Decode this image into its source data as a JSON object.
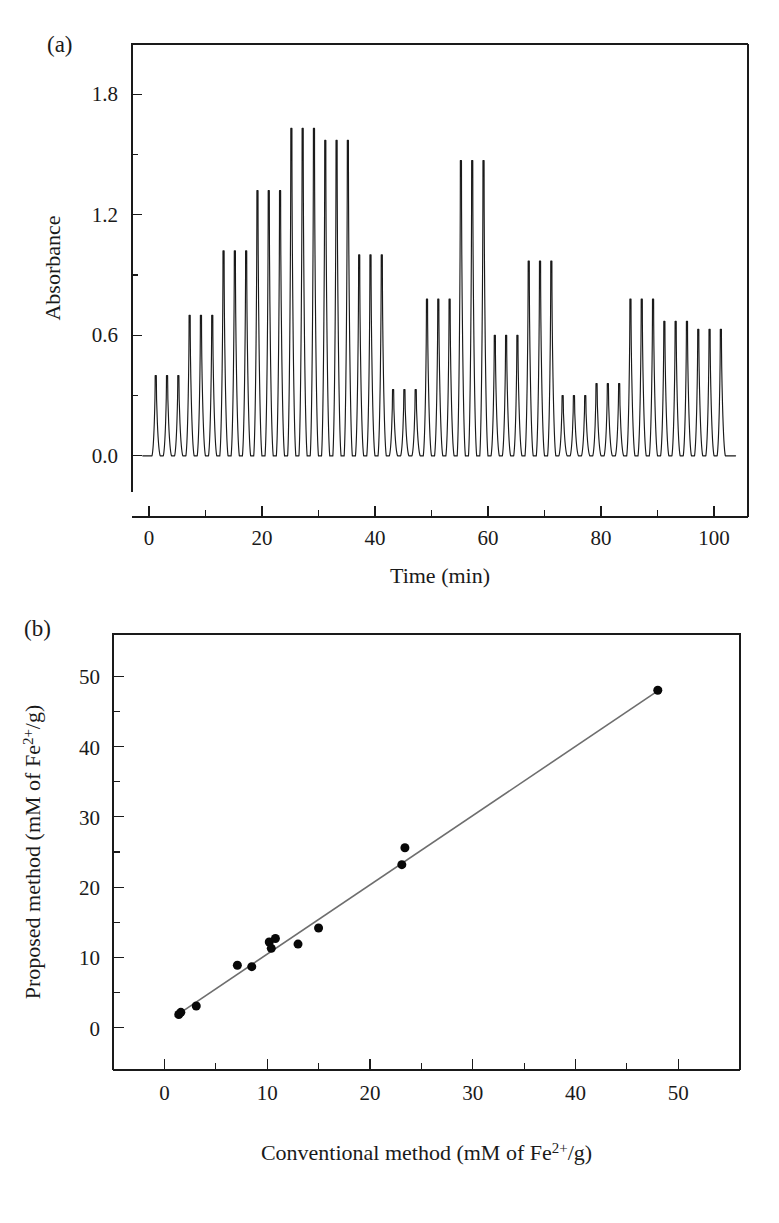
{
  "figure": {
    "panel_a_label": "(a)",
    "panel_b_label": "(b)"
  },
  "chart_data": [
    {
      "id": "panel-a",
      "type": "line",
      "title": "",
      "xlabel": "Time (min)",
      "ylabel": "Absorbance",
      "xlim": [
        -3,
        106
      ],
      "ylim": [
        -0.18,
        2.05
      ],
      "xticks": [
        0,
        20,
        40,
        60,
        80,
        100
      ],
      "xticks_minor": [
        10,
        30,
        50,
        70,
        90
      ],
      "yticks": [
        0.0,
        0.6,
        1.2,
        1.8
      ],
      "ytick_labels": [
        "0.0",
        "0.6",
        "1.2",
        "1.8"
      ],
      "yticks_minor": [
        0.3,
        0.9,
        1.5
      ],
      "grid": false,
      "legend": "none",
      "description": "Flow-injection absorbance trace: 17 triplicate injections (5 standards then 12 samples).",
      "peak_groups": [
        {
          "label": "0.1 mM",
          "x_center": 3.2,
          "height": 0.4
        },
        {
          "label": "0.2 mM",
          "x_center": 9.2,
          "height": 0.7
        },
        {
          "label": "0.3 mM",
          "x_center": 15.2,
          "height": 1.02
        },
        {
          "label": "0.4 mM",
          "x_center": 21.2,
          "height": 1.32
        },
        {
          "label": "0.5 mM",
          "x_center": 27.2,
          "height": 1.63
        },
        {
          "label": "SMP-1",
          "x_center": 33.2,
          "height": 1.57
        },
        {
          "label": "SMP-2",
          "x_center": 39.2,
          "height": 1.0
        },
        {
          "label": "SMP-3",
          "x_center": 45.2,
          "height": 0.33
        },
        {
          "label": "SMP-4",
          "x_center": 51.2,
          "height": 0.78
        },
        {
          "label": "SMP-5",
          "x_center": 57.2,
          "height": 1.47
        },
        {
          "label": "SMP-6",
          "x_center": 63.2,
          "height": 0.6
        },
        {
          "label": "SMP-7",
          "x_center": 69.2,
          "height": 0.97
        },
        {
          "label": "SMP-8",
          "x_center": 75.2,
          "height": 0.3
        },
        {
          "label": "SMP-9",
          "x_center": 81.2,
          "height": 0.36
        },
        {
          "label": "SMP-10",
          "x_center": 87.2,
          "height": 0.78
        },
        {
          "label": "SMP-11",
          "x_center": 93.2,
          "height": 0.67
        },
        {
          "label": "SMP-12",
          "x_center": 99.2,
          "height": 0.63
        }
      ],
      "peaks_per_group": 3,
      "peak_spacing": 2.0,
      "peak_width": 1.1,
      "baseline": 0.0
    },
    {
      "id": "panel-b",
      "type": "scatter",
      "title": "",
      "xlabel": "Conventional method (mM of Fe2+/g)",
      "xlabel_parts": {
        "pre": "Conventional method (mM of Fe",
        "sup": "2+",
        "post": "/g)"
      },
      "ylabel": "Proposed method (mM of Fe2+/g)",
      "ylabel_parts": {
        "pre": "Proposed method (mM of Fe",
        "sup": "2+",
        "post": "/g)"
      },
      "xlim": [
        -5,
        56
      ],
      "ylim": [
        -6,
        56
      ],
      "xticks": [
        0,
        10,
        20,
        30,
        40,
        50
      ],
      "yticks": [
        0,
        10,
        20,
        30,
        40,
        50
      ],
      "xticks_minor": [
        5,
        15,
        25,
        35,
        45
      ],
      "yticks_minor": [
        5,
        15,
        25,
        35,
        45
      ],
      "grid": false,
      "legend": "none",
      "marker": "filled-circle",
      "marker_size": 9,
      "description": "Correlation of proposed method vs conventional method with fitted regression line.",
      "points": [
        {
          "x": 1.4,
          "y": 1.9
        },
        {
          "x": 1.6,
          "y": 2.2
        },
        {
          "x": 3.1,
          "y": 3.1
        },
        {
          "x": 7.1,
          "y": 8.9
        },
        {
          "x": 8.5,
          "y": 8.7
        },
        {
          "x": 10.2,
          "y": 12.2
        },
        {
          "x": 10.4,
          "y": 11.3
        },
        {
          "x": 10.8,
          "y": 12.7
        },
        {
          "x": 13.0,
          "y": 11.9
        },
        {
          "x": 15.0,
          "y": 14.2
        },
        {
          "x": 23.1,
          "y": 23.2
        },
        {
          "x": 23.4,
          "y": 25.6
        },
        {
          "x": 48.0,
          "y": 48.0
        }
      ],
      "fit_line": {
        "x_start": 1.0,
        "y_start": 1.6,
        "x_end": 48.4,
        "y_end": 48.3
      }
    }
  ]
}
